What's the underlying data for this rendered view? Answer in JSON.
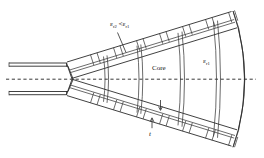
{
  "figure": {
    "name": "dielectric-lens-loaded-horn-antenna-cross-section",
    "labels": {
      "eps_r2_relation": {
        "eps_symbol": "ε",
        "sub_left": "r2",
        "relation": "<",
        "eps_symbol_2": "ε",
        "sub_right": "r1",
        "full_text": "εr2 < εr1"
      },
      "core": "Core",
      "eps_r1": {
        "eps_symbol": "ε",
        "sub": "r1",
        "full_text": "εr1"
      },
      "thickness": "t"
    },
    "colors": {
      "line": "#2b2b2b",
      "thin_line": "#3a3a3a",
      "axis": "#222222",
      "background": "#ffffff"
    },
    "elements": {
      "waveguide": "parallel-plate-feed",
      "axis": "dashed-centerline",
      "upper_wall": "corrugated-flare-wall",
      "lower_wall": "corrugated-flare-wall",
      "aperture": "curved-arc-aperture",
      "lens_slabs_count": 4,
      "corrugation_cells_per_wall": 7
    }
  }
}
